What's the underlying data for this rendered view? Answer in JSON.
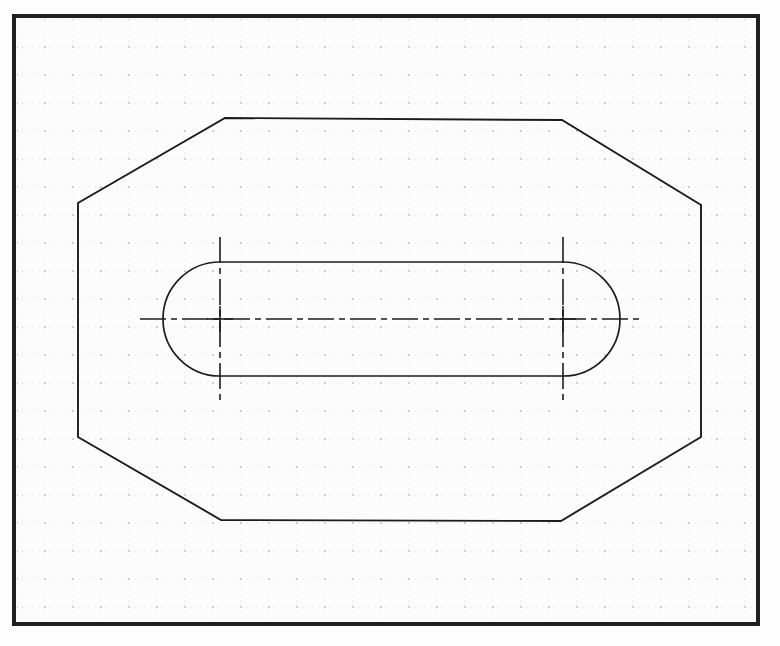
{
  "page": {
    "kind": "engineering-drawing-scan",
    "width": 780,
    "height": 646,
    "background_color": "#fdfdfd",
    "paper_color": "#fcfcfc",
    "ink_color": "#1a1a1a",
    "grid_dot_color": "#b9b9b9",
    "grid_major_dot_color": "#8f8f8f"
  },
  "border": {
    "name": "drawing-frame",
    "x": 12,
    "y": 14,
    "width": 748,
    "height": 612,
    "stroke_width": 4,
    "color": "#202020"
  },
  "grid": {
    "name": "dotted-graph-grid",
    "origin_x": 17,
    "origin_y": 19,
    "minor_spacing": 5.6,
    "major_every": 5,
    "minor_dot_radius": 0.42,
    "major_dot_radius": 0.78,
    "area": {
      "x": 17,
      "y": 19,
      "width": 738,
      "height": 602
    }
  },
  "shapes": {
    "outline": {
      "name": "octagon-outline",
      "type": "polygon",
      "stroke_width": 1.9,
      "color": "#1c1c1c",
      "points": [
        [
          225,
          118
        ],
        [
          562,
          120
        ],
        [
          701,
          205
        ],
        [
          701,
          437
        ],
        [
          561,
          521
        ],
        [
          221,
          520
        ],
        [
          78,
          437
        ],
        [
          78,
          203
        ]
      ]
    },
    "slot": {
      "name": "slot-rounded-rectangle",
      "type": "stadium",
      "stroke_width": 1.7,
      "color": "#1c1c1c",
      "left_center_x": 220,
      "right_center_x": 563,
      "center_y": 319,
      "radius": 57,
      "top_y": 262,
      "bottom_y": 376
    }
  },
  "centerlines": {
    "name": "center-lines",
    "color": "#1c1c1c",
    "stroke_width": 1.6,
    "dash_pattern": "26 5 6 5",
    "horizontal": {
      "name": "horizontal-centerline",
      "x1": 140,
      "x2": 641,
      "y": 319
    },
    "vertical": [
      {
        "name": "left-vertical-centerline",
        "x": 220,
        "y1": 237,
        "y2": 401
      },
      {
        "name": "right-vertical-centerline",
        "x": 563,
        "y1": 237,
        "y2": 401
      }
    ],
    "crosshairs": [
      {
        "name": "left-arc-center-mark",
        "cx": 220,
        "cy": 319
      },
      {
        "name": "right-arc-center-mark",
        "cx": 563,
        "cy": 319
      }
    ]
  },
  "chart_data": {
    "type": "diagram",
    "xlabel": "",
    "ylabel": "",
    "grid": true,
    "legend": "none",
    "entities": [
      {
        "name": "octagon-outline",
        "geometry": "polygon",
        "vertices": [
          [
            225,
            118
          ],
          [
            562,
            120
          ],
          [
            701,
            205
          ],
          [
            701,
            437
          ],
          [
            561,
            521
          ],
          [
            221,
            520
          ],
          [
            78,
            437
          ],
          [
            78,
            203
          ]
        ]
      },
      {
        "name": "slot-rounded-rectangle",
        "geometry": "stadium",
        "left_center": [
          220,
          319
        ],
        "right_center": [
          563,
          319
        ],
        "radius": 57
      },
      {
        "name": "horizontal-centerline",
        "geometry": "dashdot-line",
        "from": [
          140,
          319
        ],
        "to": [
          641,
          319
        ]
      },
      {
        "name": "left-vertical-centerline",
        "geometry": "dashdot-line",
        "from": [
          220,
          237
        ],
        "to": [
          220,
          401
        ]
      },
      {
        "name": "right-vertical-centerline",
        "geometry": "dashdot-line",
        "from": [
          563,
          237
        ],
        "to": [
          563,
          401
        ]
      }
    ]
  }
}
